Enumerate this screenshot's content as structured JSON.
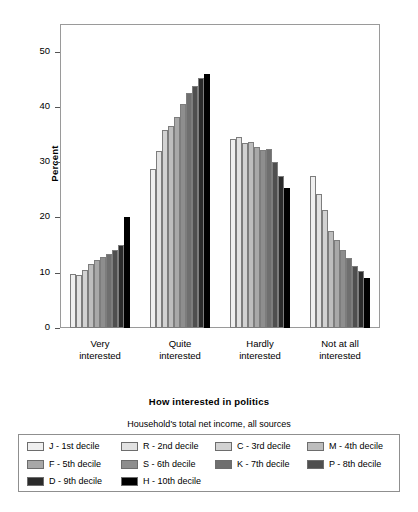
{
  "chart_data": {
    "type": "bar",
    "title": "",
    "xlabel": "How interested in politics",
    "ylabel": "Percent",
    "ylim": [
      0,
      55
    ],
    "yticks": [
      0,
      10,
      20,
      30,
      40,
      50
    ],
    "grid": false,
    "legend_position": "bottom",
    "legend_title": "Household's total net income, all sources",
    "categories": [
      "Very interested",
      "Quite interested",
      "Hardly interested",
      "Not at all interested"
    ],
    "category_lines": [
      [
        "Very",
        "interested"
      ],
      [
        "Quite",
        "interested"
      ],
      [
        "Hardly",
        "interested"
      ],
      [
        "Not at all",
        "interested"
      ]
    ],
    "series": [
      {
        "name": "J - 1st decile",
        "code": "J",
        "color": "#efefef",
        "values": [
          9.8,
          28.7,
          34.2,
          27.5
        ]
      },
      {
        "name": "R - 2nd decile",
        "code": "R",
        "color": "#e2e2e2",
        "values": [
          9.6,
          32.1,
          34.6,
          24.2
        ]
      },
      {
        "name": "C - 3rd decile",
        "code": "C",
        "color": "#d2d2d2",
        "values": [
          10.5,
          35.8,
          33.5,
          21.4
        ]
      },
      {
        "name": "M - 4th decile",
        "code": "M",
        "color": "#bdbdbd",
        "values": [
          11.5,
          36.5,
          33.6,
          17.6
        ]
      },
      {
        "name": "F - 5th decile",
        "code": "F",
        "color": "#a8a8a8",
        "values": [
          12.3,
          38.2,
          32.8,
          15.9
        ]
      },
      {
        "name": "S - 6th decile",
        "code": "S",
        "color": "#8e8e8e",
        "values": [
          12.8,
          40.5,
          32.2,
          14.2
        ]
      },
      {
        "name": "K - 7th decile",
        "code": "K",
        "color": "#6f6f6f",
        "values": [
          13.4,
          42.5,
          32.4,
          12.6
        ]
      },
      {
        "name": "P - 8th decile",
        "code": "P",
        "color": "#4f4f4f",
        "values": [
          14.2,
          43.8,
          30.1,
          11.3
        ]
      },
      {
        "name": "D - 9th decile",
        "code": "D",
        "color": "#2b2b2b",
        "values": [
          15.0,
          45.2,
          27.5,
          10.3
        ]
      },
      {
        "name": "H - 10th decile",
        "code": "H",
        "color": "#000000",
        "values": [
          20.1,
          46.0,
          25.3,
          9.0
        ]
      }
    ]
  }
}
